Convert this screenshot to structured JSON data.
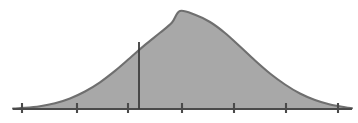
{
  "chart_data": {
    "type": "area",
    "title": "",
    "subtitle": "",
    "xlabel": "",
    "ylabel": "",
    "grid": false,
    "legend": null,
    "distribution": "normal",
    "mean_x": 180,
    "std_dev_x": 62,
    "peak": {
      "x": 180,
      "y": 11
    },
    "baseline_y": 109,
    "axis": {
      "x_start": 13,
      "x_end": 352,
      "y": 109,
      "ticks_x": [
        22,
        77,
        128,
        182,
        234,
        286,
        338
      ],
      "tick_labels": [
        "",
        "",
        "",
        "",
        "",
        "",
        ""
      ],
      "tick_length_up": 6,
      "tick_length_down": 4,
      "xlim": [
        13,
        352
      ]
    },
    "shaded_region": {
      "fill_from_x": 13,
      "fill_to_x": 352,
      "label": ""
    },
    "reference_line": {
      "x": 139,
      "y_top": 42,
      "y_bottom": 109,
      "label": ""
    },
    "curve_points": [
      {
        "x": 13,
        "y": 108.6
      },
      {
        "x": 25,
        "y": 107.9
      },
      {
        "x": 40,
        "y": 106.2
      },
      {
        "x": 55,
        "y": 103.2
      },
      {
        "x": 70,
        "y": 98.4
      },
      {
        "x": 85,
        "y": 91.5
      },
      {
        "x": 100,
        "y": 82.3
      },
      {
        "x": 115,
        "y": 70.9
      },
      {
        "x": 130,
        "y": 58.0
      },
      {
        "x": 145,
        "y": 44.9
      },
      {
        "x": 160,
        "y": 32.8
      },
      {
        "x": 172,
        "y": 22.5
      },
      {
        "x": 180,
        "y": 11.0
      },
      {
        "x": 195,
        "y": 14.8
      },
      {
        "x": 210,
        "y": 22.0
      },
      {
        "x": 225,
        "y": 33.0
      },
      {
        "x": 240,
        "y": 46.5
      },
      {
        "x": 255,
        "y": 60.5
      },
      {
        "x": 270,
        "y": 73.5
      },
      {
        "x": 285,
        "y": 84.5
      },
      {
        "x": 300,
        "y": 93.5
      },
      {
        "x": 315,
        "y": 100.0
      },
      {
        "x": 330,
        "y": 104.5
      },
      {
        "x": 345,
        "y": 107.2
      },
      {
        "x": 352,
        "y": 108.2
      }
    ],
    "colors": {
      "background": "#ffffff",
      "fill": "#a8a8a8",
      "curve_stroke": "#6f6f6f",
      "axis_stroke": "#4a4a4a",
      "tick_stroke": "#4a4a4a",
      "reference_line_stroke": "#3d3d3d"
    }
  }
}
